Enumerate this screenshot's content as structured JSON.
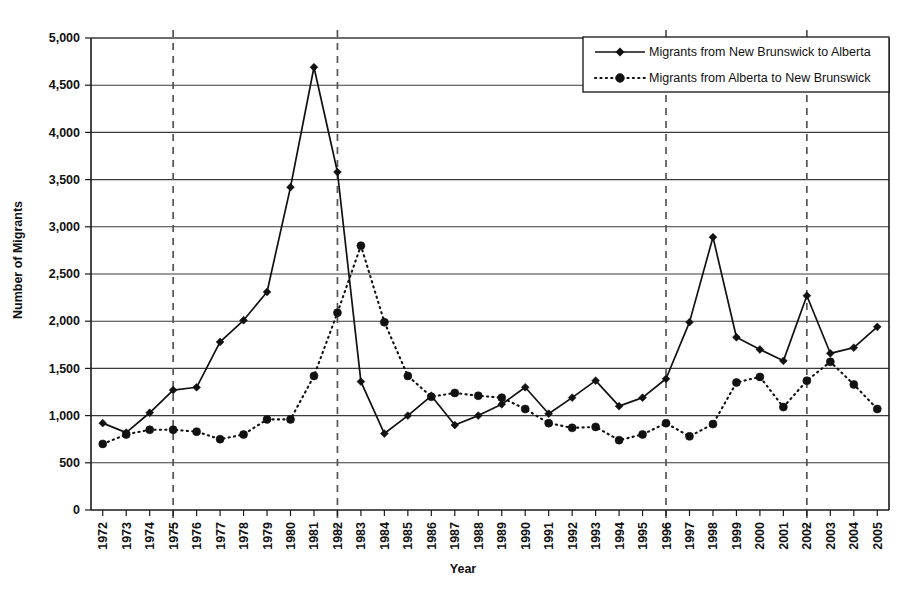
{
  "chart_data": {
    "type": "line",
    "title": "",
    "xlabel": "Year",
    "ylabel": "Number of Migrants",
    "ylim": [
      0,
      5000
    ],
    "ytick_step": 500,
    "ytick_labels": [
      "0",
      "500",
      "1,000",
      "1,500",
      "2,000",
      "2,500",
      "3,000",
      "3,500",
      "4,000",
      "4,500",
      "5,000"
    ],
    "ytick_values": [
      0,
      500,
      1000,
      1500,
      2000,
      2500,
      3000,
      3500,
      4000,
      4500,
      5000
    ],
    "grid": "horizontal",
    "legend_position": "top-right",
    "reference_lines": [
      1975,
      1982,
      1996,
      2002
    ],
    "categories": [
      1972,
      1973,
      1974,
      1975,
      1976,
      1977,
      1978,
      1979,
      1980,
      1981,
      1982,
      1983,
      1984,
      1985,
      1986,
      1987,
      1988,
      1989,
      1990,
      1991,
      1992,
      1993,
      1994,
      1995,
      1996,
      1997,
      1998,
      1999,
      2000,
      2001,
      2002,
      2003,
      2004,
      2005
    ],
    "x": [
      "1972",
      "1973",
      "1974",
      "1975",
      "1976",
      "1977",
      "1978",
      "1979",
      "1980",
      "1981",
      "1982",
      "1983",
      "1984",
      "1985",
      "1986",
      "1987",
      "1988",
      "1989",
      "1990",
      "1991",
      "1992",
      "1993",
      "1994",
      "1995",
      "1996",
      "1997",
      "1998",
      "1999",
      "2000",
      "2001",
      "2002",
      "2003",
      "2004",
      "2005"
    ],
    "series": [
      {
        "name": "Migrants from New Brunswick to Alberta",
        "marker": "diamond",
        "line_style": "solid",
        "color": "#111111",
        "values": [
          920,
          820,
          1030,
          1270,
          1300,
          1780,
          2010,
          2310,
          3420,
          4690,
          3580,
          1360,
          810,
          1000,
          1210,
          900,
          1000,
          1120,
          1300,
          1020,
          1190,
          1370,
          1100,
          1190,
          1390,
          1990,
          2890,
          1830,
          1700,
          1580,
          2270,
          1660,
          1720,
          1940
        ]
      },
      {
        "name": "Migrants from Alberta to New Brunswick",
        "marker": "circle",
        "line_style": "dotted",
        "color": "#111111",
        "values": [
          700,
          800,
          850,
          850,
          830,
          750,
          800,
          960,
          960,
          1420,
          2090,
          2800,
          1990,
          1420,
          1200,
          1240,
          1210,
          1190,
          1070,
          920,
          870,
          880,
          740,
          800,
          920,
          780,
          910,
          1350,
          1410,
          1090,
          1370,
          1570,
          1330,
          1070
        ]
      }
    ]
  },
  "legend": {
    "entries": [
      {
        "label": "Migrants from New Brunswick to Alberta",
        "marker": "diamond",
        "line_style": "solid"
      },
      {
        "label": "Migrants from Alberta to New Brunswick",
        "marker": "circle",
        "line_style": "dotted"
      }
    ]
  }
}
